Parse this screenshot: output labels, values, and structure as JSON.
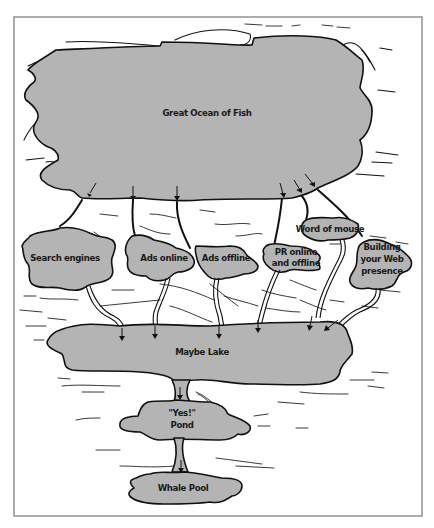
{
  "diagram": {
    "type": "metaphorical-flow-map",
    "colors": {
      "water": "#b4b4b4",
      "outline": "#111111",
      "background": "#ffffff",
      "frame": "#8a8a8a"
    },
    "source": {
      "id": "great-ocean",
      "label": "Great Ocean of Fish"
    },
    "channels": [
      {
        "id": "search-engines",
        "label": "Search engines"
      },
      {
        "id": "ads-online",
        "label": "Ads online"
      },
      {
        "id": "ads-offline",
        "label": "Ads offline"
      },
      {
        "id": "pr",
        "label_lines": [
          "PR online",
          "and offline"
        ]
      },
      {
        "id": "word-of-mouse",
        "label": "Word of mouse"
      },
      {
        "id": "web-presence",
        "label_lines": [
          "Building",
          "your Web",
          "presence"
        ]
      }
    ],
    "stages": [
      {
        "id": "maybe-lake",
        "label": "Maybe Lake"
      },
      {
        "id": "yes-pond",
        "label_lines": [
          "\"Yes!\"",
          "Pond"
        ]
      },
      {
        "id": "whale-pool",
        "label": "Whale Pool"
      }
    ],
    "flows": [
      [
        "great-ocean",
        "search-engines"
      ],
      [
        "great-ocean",
        "ads-online"
      ],
      [
        "great-ocean",
        "ads-offline"
      ],
      [
        "great-ocean",
        "pr"
      ],
      [
        "great-ocean",
        "word-of-mouse"
      ],
      [
        "great-ocean",
        "web-presence"
      ],
      [
        "search-engines",
        "maybe-lake"
      ],
      [
        "ads-online",
        "maybe-lake"
      ],
      [
        "ads-offline",
        "maybe-lake"
      ],
      [
        "pr",
        "maybe-lake"
      ],
      [
        "word-of-mouse",
        "maybe-lake"
      ],
      [
        "web-presence",
        "maybe-lake"
      ],
      [
        "maybe-lake",
        "yes-pond"
      ],
      [
        "yes-pond",
        "whale-pool"
      ]
    ]
  }
}
